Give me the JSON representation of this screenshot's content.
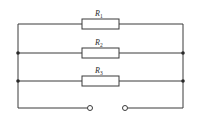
{
  "diagram": {
    "type": "circuit",
    "resistors": [
      {
        "label": "R",
        "subscript": "1",
        "y": 24
      },
      {
        "label": "R",
        "subscript": "2",
        "y": 53
      },
      {
        "label": "R",
        "subscript": "3",
        "y": 81
      }
    ],
    "terminals": [
      {
        "name": "left-terminal",
        "x": 90,
        "y": 108
      },
      {
        "name": "right-terminal",
        "x": 125,
        "y": 108
      }
    ],
    "rails": {
      "left_x": 18,
      "right_x": 183,
      "top_y": 24,
      "bottom_y": 108
    },
    "resistor_box": {
      "x1": 82,
      "x2": 119,
      "height": 10
    },
    "junctions": [
      {
        "x": 18,
        "y": 53
      },
      {
        "x": 18,
        "y": 81
      },
      {
        "x": 183,
        "y": 53
      },
      {
        "x": 183,
        "y": 81
      }
    ],
    "colors": {
      "wire": "#3a3a3a",
      "background": "#ffffff"
    }
  }
}
